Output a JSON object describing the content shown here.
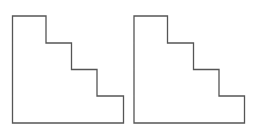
{
  "diagram": {
    "background": "#ffffff",
    "stroke_color": "#555555",
    "stroke_width": 1.3,
    "shapes": [
      {
        "name": "staircase-shape-left",
        "points": "12.5,16 46,16 46,43 71.5,43 71.5,69.5 97,69.5 97,96 123.5,96 123.5,123 12.5,123"
      },
      {
        "name": "staircase-shape-right",
        "points": "134,16 167.5,16 167.5,43 193.5,43 193.5,69.5 219,69.5 219,96 244.5,96 244.5,123 134,123"
      }
    ]
  }
}
